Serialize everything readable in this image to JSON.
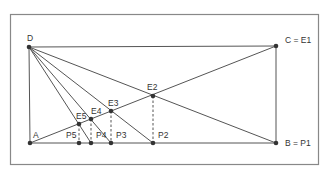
{
  "diagram": {
    "title": "",
    "colors": {
      "line": "#555555",
      "frame": "#888888",
      "point": "#333333",
      "label": "#333333",
      "background": "#ffffff"
    },
    "frame": {
      "x": 10,
      "y": 14,
      "width": 308,
      "height": 150
    },
    "points": [
      {
        "id": "D",
        "label": "D",
        "x": 29,
        "y": 47,
        "lx": 27,
        "ly": 41
      },
      {
        "id": "C",
        "label": "C = E1",
        "x": 276,
        "y": 46,
        "lx": 285,
        "ly": 43
      },
      {
        "id": "A",
        "label": "A",
        "x": 30,
        "y": 143,
        "lx": 33,
        "ly": 138
      },
      {
        "id": "B",
        "label": "B = P1",
        "x": 276,
        "y": 143,
        "lx": 285,
        "ly": 146
      },
      {
        "id": "E2",
        "label": "E2",
        "x": 153,
        "y": 96,
        "lx": 147,
        "ly": 90
      },
      {
        "id": "P2",
        "label": "P2",
        "x": 153,
        "y": 143,
        "lx": 158,
        "ly": 138
      },
      {
        "id": "E3",
        "label": "E3",
        "x": 111,
        "y": 111,
        "lx": 108,
        "ly": 106
      },
      {
        "id": "P3",
        "label": "P3",
        "x": 111,
        "y": 143,
        "lx": 116,
        "ly": 138
      },
      {
        "id": "E4",
        "label": "E4",
        "x": 91,
        "y": 119,
        "lx": 91,
        "ly": 114
      },
      {
        "id": "P4",
        "label": "P4",
        "x": 91,
        "y": 143,
        "lx": 96,
        "ly": 138
      },
      {
        "id": "E5",
        "label": "E5",
        "x": 79,
        "y": 124,
        "lx": 76,
        "ly": 119
      },
      {
        "id": "P5",
        "label": "P5",
        "x": 79,
        "y": 143,
        "lx": 66,
        "ly": 138
      }
    ],
    "segments": [
      {
        "from": "D",
        "to": "C",
        "style": "solid"
      },
      {
        "from": "C",
        "to": "B",
        "style": "solid"
      },
      {
        "from": "A",
        "to": "B",
        "style": "solid"
      },
      {
        "from": "D",
        "to": "A",
        "style": "solid"
      },
      {
        "from": "A",
        "to": "C",
        "style": "solid"
      },
      {
        "from": "D",
        "to": "B",
        "style": "solid"
      },
      {
        "from": "D",
        "to": "P2",
        "style": "solid"
      },
      {
        "from": "D",
        "to": "P3",
        "style": "solid"
      },
      {
        "from": "D",
        "to": "P4",
        "style": "solid"
      },
      {
        "from": "E2",
        "to": "P2",
        "style": "dashed"
      },
      {
        "from": "E3",
        "to": "P3",
        "style": "dashed"
      },
      {
        "from": "E4",
        "to": "P4",
        "style": "dashed"
      },
      {
        "from": "E5",
        "to": "P5",
        "style": "dashed"
      }
    ]
  }
}
